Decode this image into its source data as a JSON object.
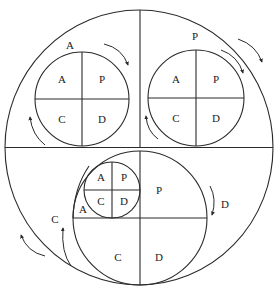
{
  "diagram": {
    "type": "nested PDCA cycle diagram",
    "colors": {
      "stroke": "#2a2a2a",
      "text": "#222222",
      "background": "#ffffff"
    },
    "outer_quadrant_labels": {
      "top_left": "A",
      "top_right": "P",
      "bottom_left": "C",
      "bottom_right": "D"
    },
    "top_left_circle": {
      "label": "A",
      "quadrants": {
        "tl": "A",
        "tr": "P",
        "bl": "C",
        "br": "D"
      }
    },
    "top_right_circle": {
      "label": "P",
      "quadrants": {
        "tl": "A",
        "tr": "P",
        "bl": "C",
        "br": "D"
      }
    },
    "bottom_circle": {
      "side_labels": {
        "left": "C",
        "right": "D"
      },
      "inner_small_circle": {
        "quadrants": {
          "tl": "A",
          "tr": "P",
          "bl": "C",
          "br": "D"
        }
      },
      "inner_a_label": "A",
      "quadrants": {
        "tr": "P",
        "bl": "C",
        "br": "D"
      }
    }
  }
}
